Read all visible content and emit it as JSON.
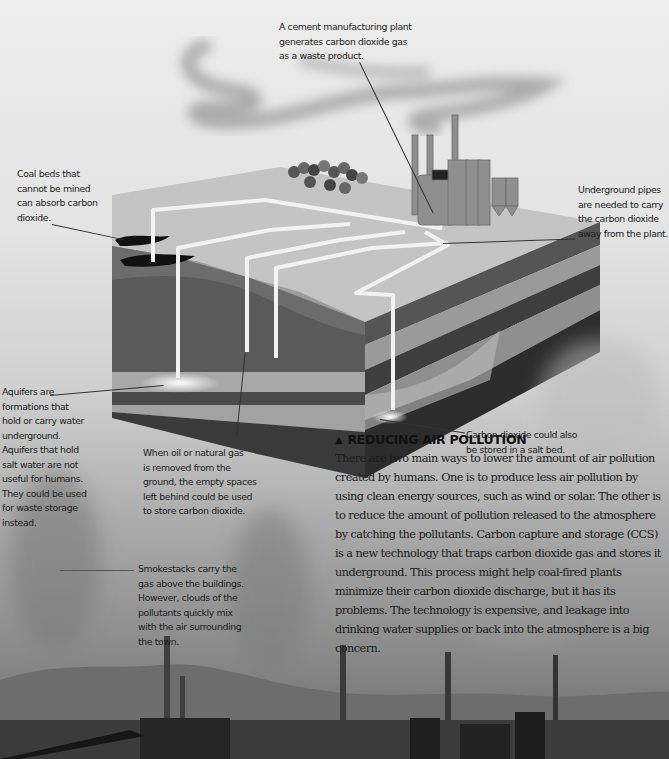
{
  "diagram": {
    "callouts": {
      "cement_plant": "A cement manufacturing plant\ngenerates carbon dioxide gas\nas a waste product.",
      "coal_beds": "Coal beds that\ncannot be mined\ncan absorb carbon\ndioxide.",
      "pipes": "Underground pipes\nare needed to carry\nthe carbon dioxide\naway from the plant.",
      "aquifers": "Aquifers are\nformations that\nhold or carry water\nunderground.\nAquifers that hold\nsalt water are not\nuseful for humans.\nThey could be used\nfor waste storage\ninstead.",
      "oil_gas": "When oil or natural gas\nis removed from the\nground, the empty spaces\nleft behind could be used\nto store carbon dioxide.",
      "salt_bed": "Carbon dioxide could also\nbe stored in a salt bed.",
      "smokestacks": "Smokestacks carry the\ngas above the buildings.\nHowever, clouds of the\npollutants quickly mix\nwith the air surrounding\nthe town."
    }
  },
  "article": {
    "title_icon": "▲",
    "title": "REDUCING AIR POLLUTION",
    "body": "There are two main ways to lower the amount of air pollution created by humans. One is to produce less air pollution by using clean energy sources, such as wind or solar. The other is to reduce the amount of pollution released to the atmosphere by catching the pollutants. Carbon capture and storage (CCS) is a new technology that traps carbon dioxide gas and stores it underground. This process might help coal-fired plants minimize their carbon dioxide discharge, but it has its problems. The technology is expensive, and leakage into drinking water supplies or back into the atmosphere is a big concern."
  },
  "colors": {
    "sky_top": "#ededed",
    "ground_top": "#bdbdbd",
    "layer_dark": "#3a3a3a",
    "layer_mid": "#8a8a8a",
    "pipe": "#f2f2f2",
    "text": "#1c1c1c"
  }
}
